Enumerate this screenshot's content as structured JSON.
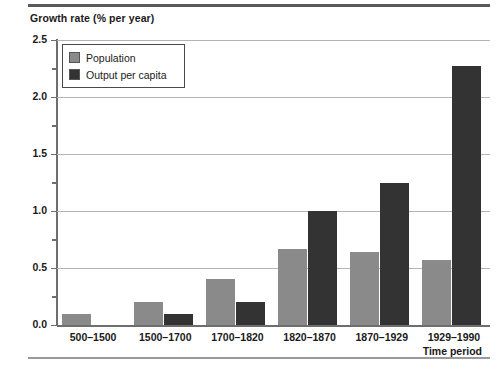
{
  "rules": {
    "top": "top-rule",
    "bottom": "bottom-rule"
  },
  "legend": {
    "position": "top-left-inside-plot",
    "entries": [
      {
        "label": "Population",
        "color": "#8a8a8a"
      },
      {
        "label": "Output per capita",
        "color": "#333333"
      }
    ]
  },
  "axes": {
    "y_title": "Growth rate (% per year)",
    "x_title": "Time period",
    "y_major_ticks": [
      "0.0",
      "0.5",
      "1.0",
      "1.5",
      "2.0",
      "2.5"
    ],
    "y_minor_ticks": [
      "0.25",
      "0.75",
      "1.25",
      "1.75",
      "2.25"
    ]
  },
  "chart_data": {
    "type": "bar",
    "title": "",
    "subtitle": "",
    "xlabel": "Time period",
    "ylabel": "Growth rate (% per year)",
    "ylim": [
      0,
      2.5
    ],
    "ytick_step": 0.5,
    "yminor_step": 0.25,
    "grid": true,
    "legend_position": "upper left",
    "categories": [
      "500–1500",
      "1500–1700",
      "1700–1820",
      "1820–1870",
      "1870–1929",
      "1929–1990"
    ],
    "series": [
      {
        "name": "Population",
        "color": "#8a8a8a",
        "values": [
          0.1,
          0.2,
          0.4,
          0.67,
          0.64,
          0.57
        ]
      },
      {
        "name": "Output per capita",
        "color": "#333333",
        "values": [
          0.0,
          0.1,
          0.2,
          1.0,
          1.25,
          2.27
        ]
      }
    ]
  }
}
